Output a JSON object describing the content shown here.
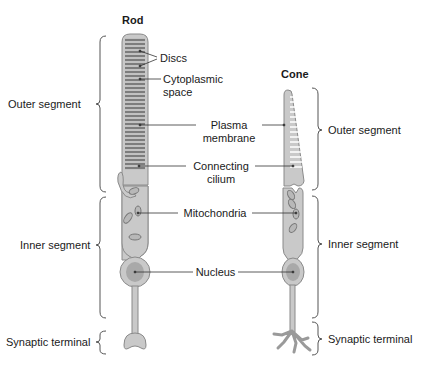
{
  "titles": {
    "rod": "Rod",
    "cone": "Cone"
  },
  "left_labels": {
    "outer": "Outer segment",
    "inner": "Inner segment",
    "synaptic": "Synaptic terminal"
  },
  "right_labels": {
    "outer": "Outer segment",
    "inner": "Inner segment",
    "synaptic": "Synaptic terminal"
  },
  "center_labels": {
    "discs": "Discs",
    "cyto1": "Cytoplasmic",
    "cyto2": "space",
    "plasma1": "Plasma",
    "plasma2": "membrane",
    "cilium1": "Connecting",
    "cilium2": "cilium",
    "mito": "Mitochondria",
    "nucleus": "Nucleus"
  },
  "colors": {
    "cell_fill": "#c9c9c9",
    "cell_stroke": "#8a8a8a",
    "disc": "#7d7d7d",
    "nucleus": "#a9a9a9",
    "line": "#333333"
  }
}
